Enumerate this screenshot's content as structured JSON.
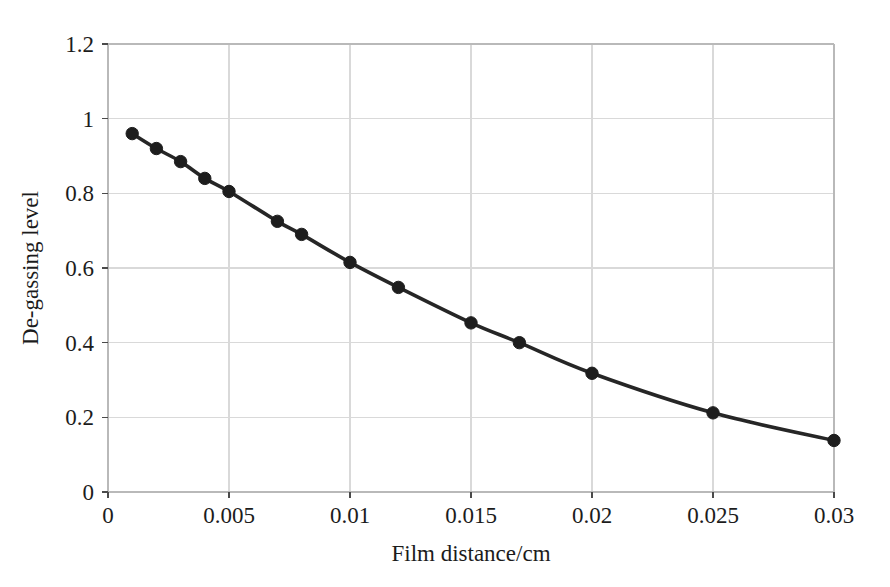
{
  "chart_data": {
    "type": "line",
    "title": "",
    "xlabel": "Film distance/cm",
    "ylabel": "De-gassing level",
    "xlim": [
      0,
      0.03
    ],
    "ylim": [
      0,
      1.2
    ],
    "grid": true,
    "legend": false,
    "legend_position": "none",
    "marker": "filled-circle",
    "line_color": "#262626",
    "marker_color": "#1d1d1d",
    "grid_color": "#d9d9d9",
    "background_color": "#ffffff",
    "xticks": [
      0,
      0.005,
      0.01,
      0.015,
      0.02,
      0.025,
      0.03
    ],
    "xtick_labels": [
      "0",
      "0.005",
      "0.01",
      "0.015",
      "0.02",
      "0.025",
      "0.03"
    ],
    "yticks": [
      0,
      0.2,
      0.4,
      0.6,
      0.8,
      1,
      1.2
    ],
    "ytick_labels": [
      "0",
      "0.2",
      "0.4",
      "0.6",
      "0.8",
      "1",
      "1.2"
    ],
    "x": [
      0.001,
      0.002,
      0.003,
      0.004,
      0.005,
      0.007,
      0.008,
      0.01,
      0.012,
      0.015,
      0.017,
      0.02,
      0.025,
      0.03
    ],
    "y": [
      0.96,
      0.92,
      0.885,
      0.84,
      0.805,
      0.725,
      0.69,
      0.615,
      0.548,
      0.453,
      0.4,
      0.318,
      0.212,
      0.138
    ],
    "series": [
      {
        "name": "De-gassing level",
        "x": [
          0.001,
          0.002,
          0.003,
          0.004,
          0.005,
          0.007,
          0.008,
          0.01,
          0.012,
          0.015,
          0.017,
          0.02,
          0.025,
          0.03
        ],
        "values": [
          0.96,
          0.92,
          0.885,
          0.84,
          0.805,
          0.725,
          0.69,
          0.615,
          0.548,
          0.453,
          0.4,
          0.318,
          0.212,
          0.138
        ]
      }
    ]
  },
  "axes": {
    "x_title": "Film distance/cm",
    "y_title": "De-gassing level"
  }
}
